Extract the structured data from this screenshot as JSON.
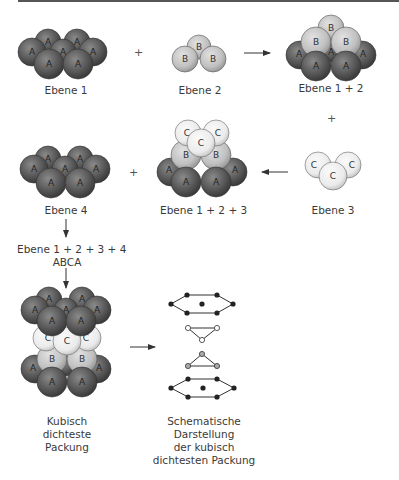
{
  "diagram": {
    "colors": {
      "A": "#5b5b5b",
      "B": "#c4c4c4",
      "C": "#ececec",
      "line": "#444444",
      "dot": "#2a2a2a"
    },
    "labels": {
      "ebene1": "Ebene 1",
      "ebene2": "Ebene 2",
      "ebene12": "Ebene 1 + 2",
      "ebene3": "Ebene 3",
      "ebene123": "Ebene 1 + 2 + 3",
      "ebene4": "Ebene 4",
      "ebene1234": "Ebene 1 + 2 + 3 + 4",
      "abca": "ABCA",
      "kubisch_line1": "Kubisch",
      "kubisch_line2": "dichteste",
      "kubisch_line3": "Packung",
      "schema_line1": "Schematische",
      "schema_line2": "Darstellung",
      "schema_line3": "der kubisch",
      "schema_line4": "dichtesten Packung"
    },
    "operators": {
      "plus": "+"
    },
    "sphere_letters": {
      "A": "A",
      "B": "B",
      "C": "C"
    }
  }
}
